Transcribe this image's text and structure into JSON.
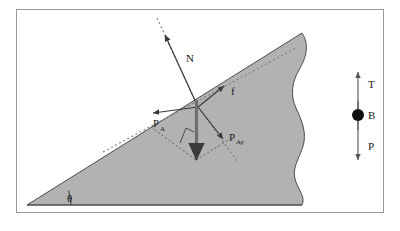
{
  "figure": {
    "frame_color": "#9a9a9a",
    "background_color": "#ffffff",
    "incline_fill_color": "#b2b2b2",
    "incline_stroke_color": "#4d4d4d",
    "vector_color": "#3a3a3a",
    "dotted_color": "#7d7d7d",
    "body_dot_color": "#111111"
  },
  "incline": {
    "angle_label": "θ",
    "angle_label_name": "theta",
    "description": "Right triangle wedge with torn right edge"
  },
  "vectors": {
    "normal": {
      "label": "N",
      "direction": "up-left perpendicular to incline surface"
    },
    "friction": {
      "label": "f",
      "direction": "up the slope along incline surface"
    },
    "weight_parallel": {
      "label": "P",
      "subscript": "A",
      "direction": "down the slope along incline surface"
    },
    "weight_perpendicular": {
      "label": "P",
      "subscript": "Ay",
      "direction": "into the incline, perpendicular"
    }
  },
  "free_body": {
    "tension": {
      "label": "T",
      "direction": "up"
    },
    "body": {
      "label": "B",
      "shape": "filled-circle"
    },
    "weight": {
      "label": "P",
      "direction": "down"
    }
  }
}
